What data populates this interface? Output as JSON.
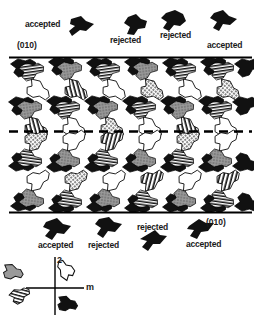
{
  "figure": {
    "title_present": false,
    "background_color": "#ffffff",
    "ink_color": "#000000"
  },
  "top_annotations": {
    "plane_index": "(010)",
    "items": [
      {
        "label": "accepted",
        "state": "accepted"
      },
      {
        "label": "rejected",
        "state": "rejected"
      },
      {
        "label": "rejected",
        "state": "rejected"
      },
      {
        "label": "accepted",
        "state": "accepted"
      }
    ]
  },
  "bottom_annotations": {
    "plane_index": "(010)",
    "items": [
      {
        "label": "accepted",
        "state": "accepted"
      },
      {
        "label": "rejected",
        "state": "rejected"
      },
      {
        "label": "rejected",
        "state": "rejected"
      },
      {
        "label": "accepted",
        "state": "accepted"
      }
    ]
  },
  "symmetry_key": {
    "rotation_label": "2",
    "mirror_label": "m",
    "quadrants": [
      {
        "position": "top-left",
        "fill": "gray"
      },
      {
        "position": "top-right",
        "fill": "white"
      },
      {
        "position": "bottom-left",
        "fill": "hatched"
      },
      {
        "position": "bottom-right",
        "fill": "black"
      }
    ]
  },
  "lattice": {
    "top_boundary_style": "solid",
    "center_boundary_style": "dashed",
    "bottom_boundary_style": "solid",
    "columns": 6,
    "rows": 4,
    "tile_fills": [
      "black",
      "hatched",
      "gray",
      "dotted",
      "white"
    ]
  },
  "colors": {
    "black": "#111111",
    "dark": "#1a1a1a",
    "gray": "#8d8d8d",
    "light_gray": "#c9c9c9",
    "white": "#ffffff",
    "line": "#000000"
  }
}
